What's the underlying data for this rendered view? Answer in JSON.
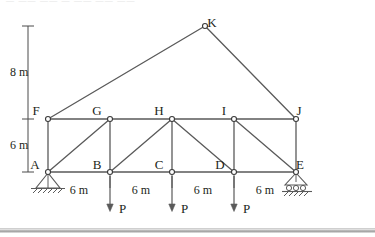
{
  "figure": {
    "nodes": [
      {
        "id": "A",
        "label": "A",
        "x": 48,
        "y": 172,
        "label_dx": -13,
        "label_dy": -3
      },
      {
        "id": "B",
        "label": "B",
        "x": 110,
        "y": 172,
        "label_dx": -13,
        "label_dy": -3
      },
      {
        "id": "C",
        "label": "C",
        "x": 172,
        "y": 172,
        "label_dx": -13,
        "label_dy": -3
      },
      {
        "id": "D",
        "label": "D",
        "x": 234,
        "y": 172,
        "label_dx": -14,
        "label_dy": -3
      },
      {
        "id": "E",
        "label": "E",
        "x": 296,
        "y": 172,
        "label_dx": 4,
        "label_dy": -3
      },
      {
        "id": "F",
        "label": "F",
        "x": 48,
        "y": 119,
        "label_dx": -12,
        "label_dy": -4
      },
      {
        "id": "G",
        "label": "G",
        "x": 110,
        "y": 119,
        "label_dx": -13,
        "label_dy": -4
      },
      {
        "id": "H",
        "label": "H",
        "x": 172,
        "y": 119,
        "label_dx": -13,
        "label_dy": -4
      },
      {
        "id": "I",
        "label": "I",
        "x": 234,
        "y": 119,
        "label_dx": -10,
        "label_dy": -4
      },
      {
        "id": "J",
        "label": "J",
        "x": 296,
        "y": 119,
        "label_dx": 3,
        "label_dy": -4
      },
      {
        "id": "K",
        "label": "K",
        "x": 205,
        "y": 26,
        "label_dx": 7,
        "label_dy": 1
      }
    ],
    "members": [
      {
        "from": "F",
        "to": "G",
        "kind": "top-chord"
      },
      {
        "from": "G",
        "to": "H",
        "kind": "top-chord"
      },
      {
        "from": "H",
        "to": "I",
        "kind": "top-chord"
      },
      {
        "from": "I",
        "to": "J",
        "kind": "top-chord"
      },
      {
        "from": "A",
        "to": "B",
        "kind": "bottom-chord"
      },
      {
        "from": "B",
        "to": "C",
        "kind": "bottom-chord"
      },
      {
        "from": "C",
        "to": "D",
        "kind": "bottom-chord"
      },
      {
        "from": "D",
        "to": "E",
        "kind": "bottom-chord"
      },
      {
        "from": "F",
        "to": "A",
        "kind": "vertical"
      },
      {
        "from": "G",
        "to": "B",
        "kind": "vertical"
      },
      {
        "from": "H",
        "to": "C",
        "kind": "vertical"
      },
      {
        "from": "I",
        "to": "D",
        "kind": "vertical"
      },
      {
        "from": "J",
        "to": "E",
        "kind": "vertical"
      },
      {
        "from": "A",
        "to": "G",
        "kind": "diagonal"
      },
      {
        "from": "B",
        "to": "H",
        "kind": "diagonal"
      },
      {
        "from": "H",
        "to": "D",
        "kind": "diagonal"
      },
      {
        "from": "I",
        "to": "E",
        "kind": "diagonal"
      },
      {
        "from": "F",
        "to": "K",
        "kind": "rafter"
      },
      {
        "from": "K",
        "to": "J",
        "kind": "rafter"
      }
    ],
    "supports": [
      {
        "at": "A",
        "type": "pinned",
        "name": "pinned-support-a"
      },
      {
        "at": "E",
        "type": "roller",
        "name": "roller-support-e"
      }
    ],
    "loads": [
      {
        "at": "B",
        "label": "P",
        "direction": "down"
      },
      {
        "at": "C",
        "label": "P",
        "direction": "down"
      },
      {
        "at": "D",
        "label": "P",
        "direction": "down"
      }
    ],
    "vertical_dimensions": [
      {
        "label": "8 m",
        "from_y": 26,
        "to_y": 119,
        "x": 28,
        "text_x": 10,
        "text_y": 76
      },
      {
        "label": "6 m",
        "from_y": 119,
        "to_y": 172,
        "x": 28,
        "text_x": 10,
        "text_y": 149
      }
    ],
    "horizontal_dimensions": [
      {
        "label": "6 m",
        "from": "A",
        "to": "B",
        "text_x": 79,
        "text_y": 194
      },
      {
        "label": "6 m",
        "from": "B",
        "to": "C",
        "text_x": 141,
        "text_y": 194
      },
      {
        "label": "6 m",
        "from": "C",
        "to": "D",
        "text_x": 203,
        "text_y": 194
      },
      {
        "label": "6 m",
        "from": "D",
        "to": "E",
        "text_x": 265,
        "text_y": 194
      }
    ],
    "colors": {
      "member": "#5a5a5a",
      "node_fill": "#ffffff",
      "node_stroke": "#3a3a3a",
      "text": "#231f20",
      "dimension": "#4a4a4a",
      "rule": "#9a9a9a"
    },
    "cutoff_text": "— —— —— — ——  ——  ——"
  }
}
